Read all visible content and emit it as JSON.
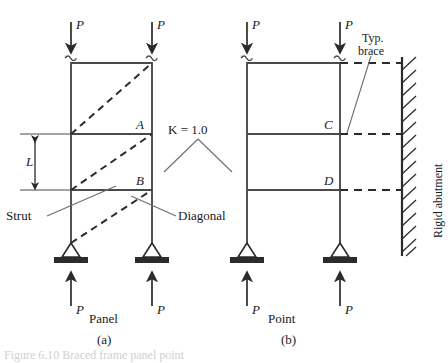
{
  "figure": {
    "title_fragment": "Figure 6.10  Braced frame panel point",
    "panels": [
      {
        "id": "a",
        "caption": "Panel",
        "tag": "(a)",
        "joint_labels": [
          "A",
          "B"
        ],
        "dimension_label": "L",
        "member_labels": [
          "Strut",
          "Diagonal"
        ],
        "top_loads": [
          "P",
          "P"
        ],
        "bottom_reactions": [
          "P",
          "P"
        ]
      },
      {
        "id": "b",
        "caption": "Point",
        "tag": "(b)",
        "joint_labels": [
          "C",
          "D"
        ],
        "member_labels": [
          "Typ.",
          "brace"
        ],
        "abutment_label": "Rigid abutment",
        "top_loads": [
          "P",
          "P"
        ],
        "bottom_reactions": [
          "P",
          "P"
        ]
      }
    ],
    "k_label": "K = 1.0",
    "colors": {
      "line": "#4a4a4a",
      "heavy": "#2b2b2b",
      "dashed": "#2b2b2b",
      "leader": "#6e6e6e",
      "text": "#1a1a1a",
      "caption": "#cfcfcf"
    }
  }
}
